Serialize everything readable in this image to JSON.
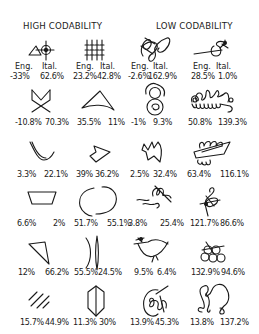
{
  "headers": {
    "high": "HIGH CODABILITY",
    "low": "LOW CODABILITY"
  },
  "column_labels": {
    "eng": "Eng.",
    "ital": "Ital."
  },
  "rows": [
    {
      "items": [
        {
          "glyph": "triangle-crosshair-glyph",
          "eng": "-33%",
          "ital": "62.6%"
        },
        {
          "glyph": "vertical-hatch-glyph",
          "eng": "23.2%",
          "ital": "42.8%"
        },
        {
          "glyph": "scribble-loop-glyph",
          "eng": "-2.6%",
          "ital": "162.9%"
        },
        {
          "glyph": "line-curl-glyph",
          "eng": "28.5%",
          "ital": "1.0%"
        }
      ]
    },
    {
      "items": [
        {
          "glyph": "crossed-m-glyph",
          "eng": "-10.8%",
          "ital": "70.3%"
        },
        {
          "glyph": "curved-triangle-glyph",
          "eng": "35.5%",
          "ital": "11%"
        },
        {
          "glyph": "stacked-circles-glyph",
          "eng": "-1%",
          "ital": "9.3%"
        },
        {
          "glyph": "loop-chain-glyph",
          "eng": "50.8%",
          "ital": "139.3%"
        }
      ]
    },
    {
      "items": [
        {
          "glyph": "double-v-curve-glyph",
          "eng": "3.3%",
          "ital": "22.1%"
        },
        {
          "glyph": "pentagon-kite-glyph",
          "eng": "39%",
          "ital": "36.2%"
        },
        {
          "glyph": "zigzag-blob-glyph",
          "eng": "2.5%",
          "ital": "32.4%"
        },
        {
          "glyph": "curl-flag-glyph",
          "eng": "63.4%",
          "ital": "116.1%"
        }
      ]
    },
    {
      "items": [
        {
          "glyph": "trapezoid-glyph",
          "eng": "6.6%",
          "ital": "2%"
        },
        {
          "glyph": "open-ellipse-glyph",
          "eng": "51.7%",
          "ital": "55.1%"
        },
        {
          "glyph": "wave-swirl-glyph",
          "eng": "3.8%",
          "ital": "25.4%"
        },
        {
          "glyph": "treble-knot-glyph",
          "eng": "121.7%",
          "ital": "86.6%"
        }
      ]
    },
    {
      "items": [
        {
          "glyph": "wedge-glyph",
          "eng": "12%",
          "ital": "66.2%"
        },
        {
          "glyph": "paren-bar-glyph",
          "eng": "55.5%",
          "ital": "24.5%"
        },
        {
          "glyph": "bird-curve-glyph",
          "eng": "9.5%",
          "ital": "6.4%"
        },
        {
          "glyph": "grape-cluster-glyph",
          "eng": "132.9%",
          "ital": "94.6%"
        }
      ]
    },
    {
      "items": [
        {
          "glyph": "diagonal-hatch-glyph",
          "eng": "15.7%",
          "ital": "44.9%"
        },
        {
          "glyph": "hexagon-split-glyph",
          "eng": "11.3%",
          "ital": "30%"
        },
        {
          "glyph": "circle-scribble-glyph",
          "eng": "13.9%",
          "ital": "45.3%"
        },
        {
          "glyph": "double-loop-glyph",
          "eng": "13.8%",
          "ital": "137.2%"
        }
      ]
    }
  ]
}
